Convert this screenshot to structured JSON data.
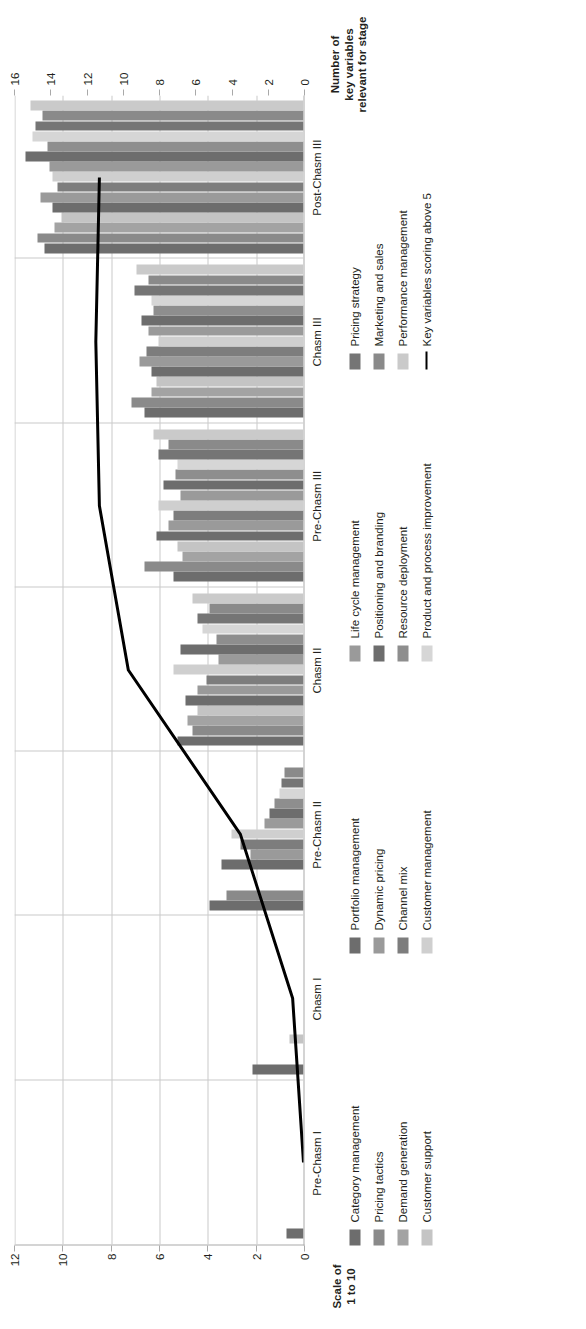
{
  "chart_data": {
    "type": "bar",
    "orientation": "horizontal-rotated",
    "title": "",
    "categories": [
      "Pre-Chasm I",
      "Chasm I",
      "Pre-Chasm II",
      "Chasm II",
      "Pre-Chasm III",
      "Chasm III",
      "Post-Chasm III"
    ],
    "xlabel": "",
    "ylabel": "Scale of 1 to 10",
    "ylabel_line1": "Scale of",
    "ylabel_line2": "1 to 10",
    "ylim": [
      0,
      12
    ],
    "yticks": [
      0,
      2,
      4,
      6,
      8,
      10,
      12
    ],
    "secondary_ylabel_line1": "Number of",
    "secondary_ylabel_line2": "key variables",
    "secondary_ylabel_line3": "relevant for stage",
    "secondary_ylim": [
      0,
      16
    ],
    "secondary_yticks": [
      0,
      2,
      4,
      6,
      8,
      10,
      12,
      14,
      16
    ],
    "grid": true,
    "legend_position": "below",
    "series": [
      {
        "name": "Category management",
        "color": "#6d6d6d",
        "values": [
          0.7,
          2.1,
          3.9,
          5.2,
          5.4,
          6.6,
          10.7
        ]
      },
      {
        "name": "Pricing tactics",
        "color": "#8a8a8a",
        "values": [
          0.0,
          0.0,
          3.2,
          4.6,
          6.6,
          7.1,
          11.0
        ]
      },
      {
        "name": "Demand generation",
        "color": "#a3a3a3",
        "values": [
          0.0,
          0.0,
          0.0,
          4.8,
          5.0,
          6.3,
          10.3
        ]
      },
      {
        "name": "Customer support",
        "color": "#c4c4c4",
        "values": [
          0.0,
          0.6,
          0.0,
          4.4,
          5.2,
          6.1,
          10.0
        ]
      },
      {
        "name": "Portfolio management",
        "color": "#6d6d6d",
        "values": [
          0.0,
          0.0,
          3.4,
          4.9,
          6.1,
          6.3,
          10.4
        ]
      },
      {
        "name": "Dynamic pricing",
        "color": "#9a9a9a",
        "values": [
          0.0,
          0.0,
          2.2,
          4.4,
          5.6,
          6.8,
          10.9
        ]
      },
      {
        "name": "Channel mix",
        "color": "#7d7d7d",
        "values": [
          0.0,
          0.0,
          2.6,
          4.0,
          5.4,
          6.5,
          10.2
        ]
      },
      {
        "name": "Customer management",
        "color": "#cfcfcf",
        "values": [
          0.0,
          0.0,
          3.0,
          5.4,
          6.0,
          6.0,
          10.4
        ]
      },
      {
        "name": "Life cycle management",
        "color": "#9a9a9a",
        "values": [
          0.0,
          0.0,
          1.6,
          3.5,
          5.1,
          6.4,
          10.5
        ]
      },
      {
        "name": "Positioning and branding",
        "color": "#6d6d6d",
        "values": [
          0.0,
          0.0,
          1.4,
          5.1,
          5.8,
          6.7,
          11.5
        ]
      },
      {
        "name": "Resource deployment",
        "color": "#8e8e8e",
        "values": [
          0.0,
          0.0,
          1.2,
          3.6,
          5.3,
          6.2,
          10.6
        ]
      },
      {
        "name": "Product and process improvement",
        "color": "#d6d6d6",
        "values": [
          0.0,
          0.0,
          1.0,
          4.2,
          5.2,
          6.3,
          11.2
        ]
      },
      {
        "name": "Pricing strategy",
        "color": "#757575",
        "values": [
          0.0,
          0.0,
          0.9,
          4.4,
          6.0,
          7.0,
          11.1
        ]
      },
      {
        "name": "Marketing and sales",
        "color": "#8a8a8a",
        "values": [
          0.0,
          0.0,
          0.8,
          3.9,
          5.6,
          6.4,
          10.8
        ]
      },
      {
        "name": "Performance management",
        "color": "#cacaca",
        "values": [
          0.0,
          0.0,
          0.0,
          4.6,
          6.2,
          6.9,
          11.3
        ]
      }
    ],
    "line_series": {
      "name": "Key variables scoring above 5",
      "color": "#000000",
      "axis": "secondary",
      "values": [
        0,
        0.6,
        3.5,
        9.7,
        11.3,
        11.5,
        11.3
      ]
    }
  },
  "legend": {
    "columns": [
      {
        "items": [
          {
            "label": "Category management",
            "color": "#6d6d6d",
            "type": "swatch"
          },
          {
            "label": "Pricing tactics",
            "color": "#8a8a8a",
            "type": "swatch"
          },
          {
            "label": "Demand generation",
            "color": "#a3a3a3",
            "type": "swatch"
          },
          {
            "label": "Customer support",
            "color": "#c4c4c4",
            "type": "swatch"
          }
        ]
      },
      {
        "items": [
          {
            "label": "Portfolio management",
            "color": "#6d6d6d",
            "type": "swatch"
          },
          {
            "label": "Dynamic pricing",
            "color": "#9a9a9a",
            "type": "swatch"
          },
          {
            "label": "Channel mix",
            "color": "#7d7d7d",
            "type": "swatch"
          },
          {
            "label": "Customer management",
            "color": "#cfcfcf",
            "type": "swatch"
          }
        ]
      },
      {
        "items": [
          {
            "label": "Life cycle management",
            "color": "#9a9a9a",
            "type": "swatch"
          },
          {
            "label": "Positioning and branding",
            "color": "#6d6d6d",
            "type": "swatch"
          },
          {
            "label": "Resource deployment",
            "color": "#8e8e8e",
            "type": "swatch"
          },
          {
            "label": "Product and process improvement",
            "color": "#d6d6d6",
            "type": "swatch"
          }
        ]
      },
      {
        "items": [
          {
            "label": "Pricing strategy",
            "color": "#757575",
            "type": "swatch"
          },
          {
            "label": "Marketing and sales",
            "color": "#8a8a8a",
            "type": "swatch"
          },
          {
            "label": "Performance management",
            "color": "#cacaca",
            "type": "swatch"
          },
          {
            "label": "Key variables scoring above 5",
            "color": "#000000",
            "type": "line"
          }
        ]
      }
    ]
  }
}
